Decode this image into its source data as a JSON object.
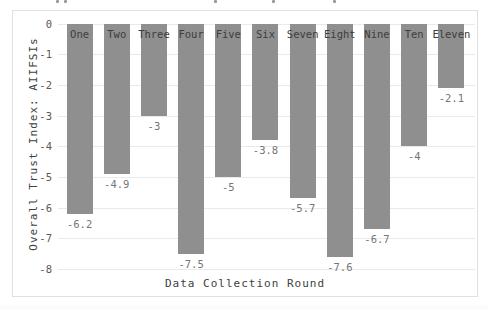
{
  "chart_data": {
    "type": "bar",
    "title": "",
    "categories": [
      "One",
      "Two",
      "Three",
      "Four",
      "Five",
      "Six",
      "Seven",
      "Eight",
      "Nine",
      "Ten",
      "Eleven"
    ],
    "values": [
      -6.2,
      -4.9,
      -3,
      -7.5,
      -5,
      -3.8,
      -5.7,
      -7.6,
      -6.7,
      -4,
      -2.1
    ],
    "value_labels": [
      "-6.2",
      "-4.9",
      "-3",
      "-7.5",
      "-5",
      "-3.8",
      "-5.7",
      "-7.6",
      "-6.7",
      "-4",
      "-2.1"
    ],
    "xlabel": "Data Collection Round",
    "ylabel": "Overall Trust Index: AIIFSIs",
    "ylim": [
      -8,
      0
    ],
    "yticks": [
      "0",
      "-1",
      "-2",
      "-3",
      "-4",
      "-5",
      "-6",
      "-7",
      "-8"
    ],
    "grid": true,
    "legend": "none",
    "colors": {
      "bar_fill": "#8f8f8f",
      "category_label": "#3d3d3d",
      "value_label": "#757575",
      "tick_label": "#595959",
      "axis_label": "#404040",
      "gridline": "#eaeaea",
      "panel_border": "#e0e0e0",
      "background": "#ffffff"
    }
  }
}
